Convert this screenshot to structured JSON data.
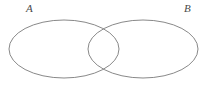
{
  "figure": {
    "type": "venn-diagram",
    "width": 208,
    "height": 90,
    "background_color": "#ffffff",
    "stroke_color": "#7a7a7a",
    "stroke_width": 0.9,
    "fill": "none",
    "label_color": "#4a4a4a"
  },
  "sets": [
    {
      "id": "A",
      "label": "A",
      "label_x": 26,
      "label_y": 3,
      "ellipse": {
        "cx": 64,
        "cy": 49,
        "rx": 55,
        "ry": 29
      }
    },
    {
      "id": "B",
      "label": "B",
      "label_x": 184,
      "label_y": 3,
      "ellipse": {
        "cx": 143,
        "cy": 49,
        "rx": 55,
        "ry": 29
      }
    }
  ],
  "intersection": {
    "crossing_top": {
      "x": 103,
      "y": 25
    },
    "crossing_bottom": {
      "x": 103,
      "y": 72
    },
    "shaded": false
  }
}
